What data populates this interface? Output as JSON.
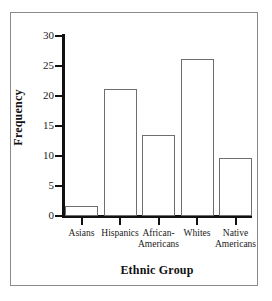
{
  "chart_data": {
    "type": "bar",
    "title": "",
    "xlabel": "Ethnic Group",
    "ylabel": "Frequency",
    "categories": [
      "Asians",
      "Hispanics",
      "African-Americans",
      "Whites",
      "Native Americans"
    ],
    "category_lines": [
      [
        "Asians"
      ],
      [
        "Hispanics"
      ],
      [
        "African-",
        "Americans"
      ],
      [
        "Whites"
      ],
      [
        "Native",
        "Americans"
      ]
    ],
    "values": [
      1.7,
      21.1,
      13.5,
      26.2,
      9.7
    ],
    "ylim": [
      0,
      30
    ],
    "yticks": [
      0,
      5,
      10,
      15,
      20,
      25,
      30
    ],
    "ytick_labels": [
      "0",
      "5",
      "10",
      "15",
      "20",
      "25",
      "30"
    ],
    "grid": false,
    "legend": false,
    "bar_fill": "#ffffff",
    "bar_edge": "#6e6e6e",
    "axis_color": "#111111",
    "frame_color": "#8a8a8a",
    "background": "#ffffff"
  }
}
